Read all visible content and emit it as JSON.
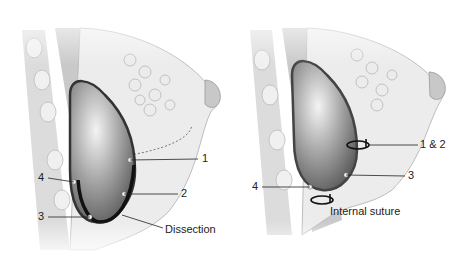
{
  "figure": {
    "left_panel": {
      "name": "Dissection technique",
      "labels": {
        "l1": "1",
        "l2": "2",
        "l3": "3",
        "l4": "4",
        "dissection": "Dissection"
      }
    },
    "right_panel": {
      "name": "Internal suture technique",
      "labels": {
        "l12": "1 & 2",
        "l3": "3",
        "l4": "4",
        "suture": "Internal suture"
      }
    },
    "colors": {
      "tissue": "#e8e8e8",
      "muscle": "#cfcfcf",
      "implant_dark": "#7a7a7a",
      "implant_light": "#f2f2f2",
      "capsule": "#333333",
      "line": "#222222"
    }
  }
}
